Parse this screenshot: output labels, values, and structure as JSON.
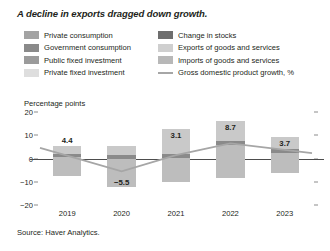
{
  "title": "A decline in exports dragged down growth.",
  "source": "Source: Haver Analytics.",
  "axis": {
    "ylabel": "Percentage points",
    "yticks": [
      "20",
      "10",
      "0",
      "−10",
      "−20"
    ],
    "ytick_values": [
      20,
      10,
      0,
      -10,
      -20
    ],
    "ylim": [
      -20,
      20
    ],
    "xticks": [
      "2019",
      "2020",
      "2021",
      "2022",
      "2023"
    ]
  },
  "legend": {
    "items": [
      {
        "label": "Private consumption",
        "color": "#a3a3a3",
        "type": "swatch",
        "column": "left"
      },
      {
        "label": "Government consumption",
        "color": "#8a8a8a",
        "type": "swatch",
        "column": "left"
      },
      {
        "label": "Public fixed investment",
        "color": "#9b9b9b",
        "type": "swatch",
        "column": "left"
      },
      {
        "label": "Private fixed investment",
        "color": "#dedede",
        "type": "swatch",
        "column": "left"
      },
      {
        "label": "Change in stocks",
        "color": "#6e6e6e",
        "type": "swatch",
        "column": "right"
      },
      {
        "label": "Exports of goods and services",
        "color": "#cfcfcf",
        "type": "swatch",
        "column": "right"
      },
      {
        "label": "Imports of goods and services",
        "color": "#b8b8b8",
        "type": "swatch",
        "column": "right"
      },
      {
        "label": "Gross domestic product growth, %",
        "color": "#a6a6a6",
        "type": "line",
        "column": "right"
      }
    ]
  },
  "chart_data": {
    "type": "bar",
    "subtype": "stacked-bar-with-line",
    "title": "A decline in exports dragged down growth.",
    "xlabel": "",
    "ylabel": "Percentage points",
    "ylim": [
      -20,
      20
    ],
    "grid": false,
    "legend_position": "top",
    "categories": [
      "2019",
      "2020",
      "2021",
      "2022",
      "2023"
    ],
    "bar_totals_positive": [
      5.2,
      5.2,
      12.8,
      16.3,
      9.2
    ],
    "bar_totals_negative": [
      -7.4,
      -12.2,
      -10.0,
      -8.2,
      -6.4
    ],
    "data_labels": [
      "4.4",
      "−5.5",
      "3.1",
      "8.7",
      "3.7"
    ],
    "series": [
      {
        "name": "Gross domestic product growth, %",
        "type": "line",
        "color": "#a6a6a6",
        "values": [
          1.2,
          -5.5,
          1.4,
          6.5,
          3.7
        ]
      }
    ],
    "stack_segments": {
      "2019": [
        {
          "name": "upper-light",
          "color": "#c9c9c9",
          "top": 5.2,
          "bottom": 2.1
        },
        {
          "name": "dark-band",
          "color": "#8a8a8a",
          "top": 2.1,
          "bottom": 0.5
        },
        {
          "name": "lower-light",
          "color": "#bdbdbd",
          "top": 0.5,
          "bottom": -7.4
        }
      ],
      "2020": [
        {
          "name": "upper-light",
          "color": "#c9c9c9",
          "top": 5.2,
          "bottom": 1.3
        },
        {
          "name": "dark-band",
          "color": "#8a8a8a",
          "top": 1.3,
          "bottom": -0.4
        },
        {
          "name": "lower-light",
          "color": "#bdbdbd",
          "top": -0.4,
          "bottom": -12.2
        }
      ],
      "2021": [
        {
          "name": "upper-light",
          "color": "#c9c9c9",
          "top": 12.8,
          "bottom": 2.1
        },
        {
          "name": "dark-band",
          "color": "#8a8a8a",
          "top": 2.1,
          "bottom": 0.4
        },
        {
          "name": "lower-light",
          "color": "#bdbdbd",
          "top": 0.4,
          "bottom": -10.0
        }
      ],
      "2022": [
        {
          "name": "upper-light",
          "color": "#c9c9c9",
          "top": 16.3,
          "bottom": 7.6
        },
        {
          "name": "dark-band",
          "color": "#8a8a8a",
          "top": 7.6,
          "bottom": 5.9
        },
        {
          "name": "lower-light",
          "color": "#bdbdbd",
          "top": 5.9,
          "bottom": -8.2
        }
      ],
      "2023": [
        {
          "name": "upper-light",
          "color": "#c9c9c9",
          "top": 9.2,
          "bottom": 4.0
        },
        {
          "name": "dark-band",
          "color": "#8a8a8a",
          "top": 4.0,
          "bottom": 2.4
        },
        {
          "name": "lower-light",
          "color": "#bdbdbd",
          "top": 2.4,
          "bottom": -6.4
        }
      ]
    }
  }
}
